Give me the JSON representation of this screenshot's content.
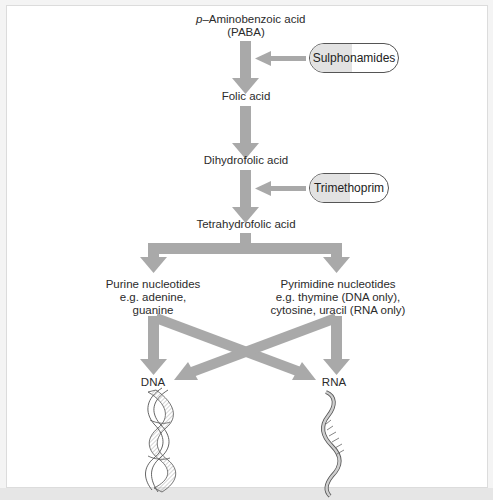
{
  "diagram": {
    "type": "metabolic-pathway",
    "nodes": {
      "paba_line1_prefix": "p",
      "paba_line1_rest": "–Aminobenzoic acid",
      "paba_line2": "(PABA)",
      "folic_acid": "Folic acid",
      "dihydrofolic_acid": "Dihydrofolic acid",
      "tetrahydrofolic_acid": "Tetrahydrofolic acid",
      "purine": [
        "Purine nucleotides",
        "e.g. adenine,",
        "guanine"
      ],
      "pyrimidine": [
        "Pyrimidine nucleotides",
        "e.g. thymine (DNA only),",
        "cytosine, uracil (RNA only)"
      ],
      "dna": "DNA",
      "rna": "RNA"
    },
    "inhibitors": [
      {
        "label": "Sulphonamides",
        "inhibits": "PABA → Folic acid"
      },
      {
        "label": "Trimethoprim",
        "inhibits": "Dihydrofolic acid → Tetrahydrofolic acid"
      }
    ],
    "edges": [
      {
        "from": "PABA",
        "to": "Folic acid"
      },
      {
        "from": "Folic acid",
        "to": "Dihydrofolic acid"
      },
      {
        "from": "Dihydrofolic acid",
        "to": "Tetrahydrofolic acid"
      },
      {
        "from": "Tetrahydrofolic acid",
        "to": "Purine nucleotides"
      },
      {
        "from": "Tetrahydrofolic acid",
        "to": "Pyrimidine nucleotides"
      },
      {
        "from": "Purine nucleotides",
        "to": "DNA"
      },
      {
        "from": "Purine nucleotides",
        "to": "RNA"
      },
      {
        "from": "Pyrimidine nucleotides",
        "to": "DNA"
      },
      {
        "from": "Pyrimidine nucleotides",
        "to": "RNA"
      }
    ],
    "icons": {
      "dna": "dna-double-helix-icon",
      "rna": "rna-single-strand-icon",
      "pill": "capsule-icon"
    },
    "colors": {
      "arrow": "#a9a9a9",
      "pill_fill": "#e2e2e2",
      "pill_border": "#555555",
      "text": "#2b2b2b",
      "background": "#ffffff"
    }
  }
}
